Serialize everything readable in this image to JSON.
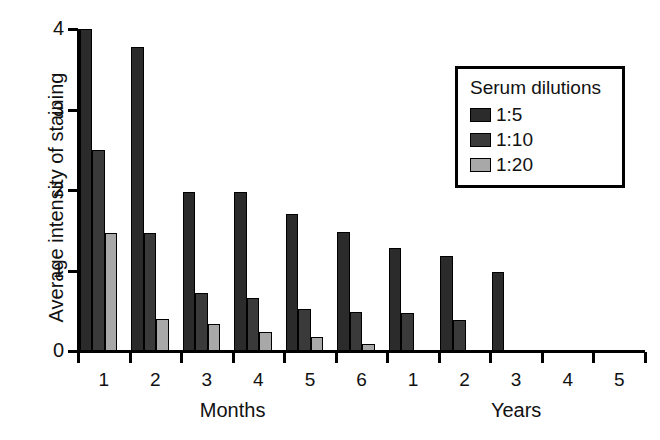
{
  "chart_data": {
    "type": "bar",
    "title": "",
    "subtitle": "",
    "xlabel": "",
    "ylabel": "Average intensity of staining",
    "ylim": [
      0,
      4
    ],
    "yticks": [
      0,
      1,
      2,
      3,
      4
    ],
    "grid": false,
    "legend_position": "top-right",
    "legend_title": "Serum dilutions",
    "group_captions": [
      "Months",
      "Years"
    ],
    "categories": [
      "1",
      "2",
      "3",
      "4",
      "5",
      "6",
      "1",
      "2",
      "3",
      "4",
      "5"
    ],
    "category_groups": [
      "Months",
      "Months",
      "Months",
      "Months",
      "Months",
      "Months",
      "Years",
      "Years",
      "Years",
      "Years",
      "Years"
    ],
    "series": [
      {
        "name": "1:5",
        "color": "#2b2b2b",
        "values": [
          4.0,
          3.78,
          1.97,
          1.98,
          1.7,
          1.48,
          1.28,
          1.18,
          0.98,
          0,
          0
        ]
      },
      {
        "name": "1:10",
        "color": "#3a3a3a",
        "values": [
          2.5,
          1.47,
          0.72,
          0.66,
          0.52,
          0.48,
          0.47,
          0.38,
          0,
          0,
          0
        ]
      },
      {
        "name": "1:20",
        "color": "#a8a8a8",
        "values": [
          1.47,
          0.4,
          0.33,
          0.24,
          0.18,
          0.09,
          0,
          0,
          0,
          0,
          0
        ]
      }
    ]
  },
  "axes": {
    "y_tick_labels": [
      "0",
      "1",
      "2",
      "3",
      "4"
    ],
    "x_tick_labels": [
      "1",
      "2",
      "3",
      "4",
      "5",
      "6",
      "1",
      "2",
      "3",
      "4",
      "5"
    ]
  },
  "legend": {
    "title": "Serum dilutions",
    "items": [
      {
        "label": "1:5",
        "color": "#2b2b2b"
      },
      {
        "label": "1:10",
        "color": "#3a3a3a"
      },
      {
        "label": "1:20",
        "color": "#a8a8a8"
      }
    ]
  },
  "colors": {
    "axis": "#000000",
    "background": "#ffffff",
    "text": "#111111"
  }
}
